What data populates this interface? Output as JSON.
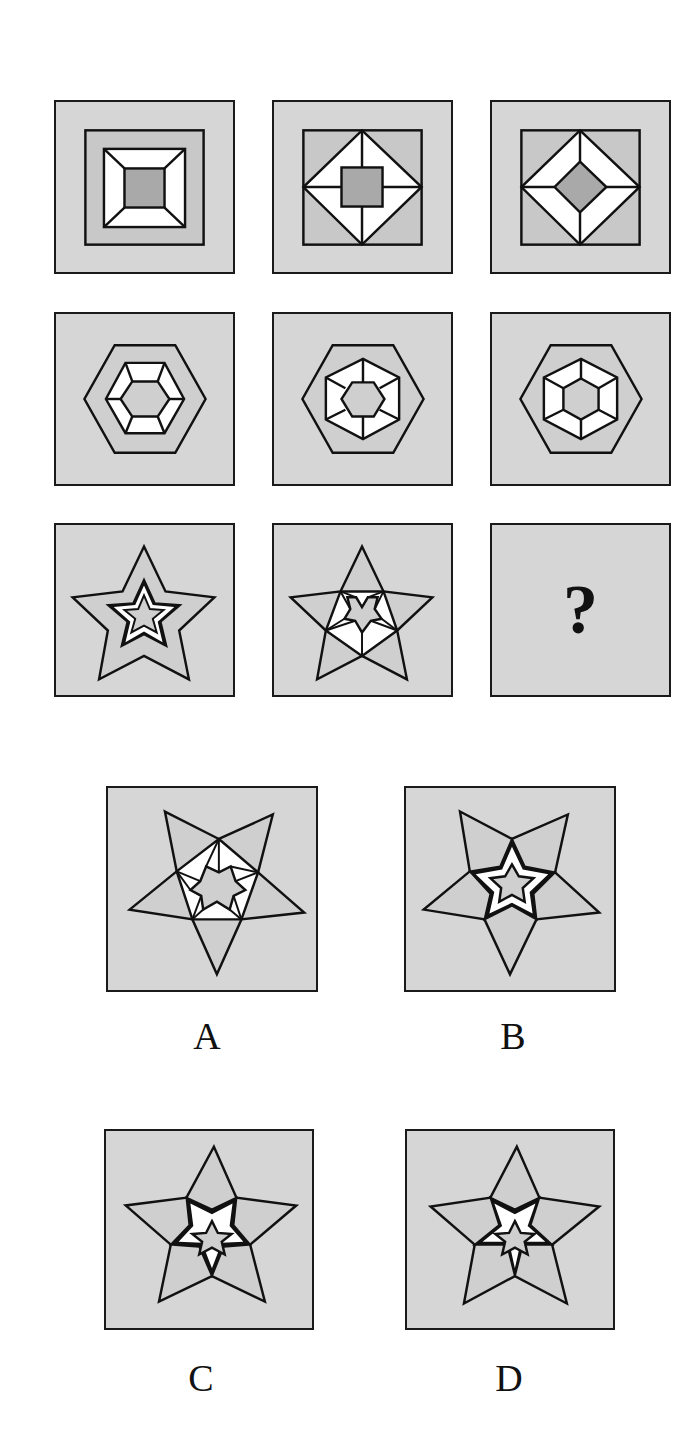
{
  "puzzle": {
    "type": "3x3 figure matrix reasoning",
    "colors": {
      "panel_bg": "#d6d6d6",
      "mid_fill": "#c4c4c4",
      "inner_fill": "#a9a9a9",
      "white": "#ffffff",
      "stroke": "#111111"
    },
    "grid": [
      {
        "row": 1,
        "shape": "square",
        "cells": [
          "nested squares, frame trapezoids",
          "diamond inscribed in square, gray center square",
          "diamond frame with gray center diamond"
        ]
      },
      {
        "row": 2,
        "shape": "hexagon",
        "cells": [
          "nested hexagons with trapezoid frame",
          "hexagon with rotated inner hexagon and spokes",
          "nested hexagons, frame split by radial lines"
        ]
      },
      {
        "row": 3,
        "shape": "star",
        "cells": [
          "nested stars with white frame",
          "star with inner spoked star",
          "?"
        ]
      }
    ],
    "missing_symbol": "?",
    "options": [
      {
        "label": "A",
        "description": "inverted outer star with spoked inner star"
      },
      {
        "label": "B",
        "description": "inverted outer star with white-frame inner star"
      },
      {
        "label": "C",
        "description": "upright star, inner white-frame star (pentagon points)"
      },
      {
        "label": "D",
        "description": "upright star, inner white-frame star variant"
      }
    ]
  }
}
